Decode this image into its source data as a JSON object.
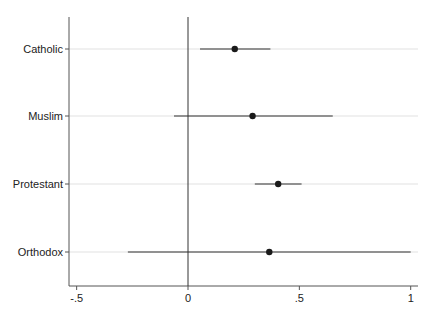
{
  "chart_data": {
    "type": "coefficient_plot",
    "title": "",
    "xlabel": "",
    "ylabel": "",
    "xlim": [
      -0.52,
      1.03
    ],
    "xticks": [
      -0.5,
      0,
      0.5,
      1
    ],
    "xtick_labels": [
      "-.5",
      "0",
      ".5",
      "1"
    ],
    "reference_line": 0,
    "grid": "horizontal",
    "categories": [
      "Catholic",
      "Muslim",
      "Protestant",
      "Orthodox"
    ],
    "estimates": [
      0.21,
      0.29,
      0.405,
      0.365
    ],
    "ci_lower": [
      0.054,
      -0.063,
      0.3,
      -0.27
    ],
    "ci_upper": [
      0.37,
      0.65,
      0.51,
      1.0
    ],
    "colors": {
      "point": "#1a1a1a",
      "ci_line": "#333333",
      "grid": "#d9d9d9",
      "axis": "#555555",
      "ref_line": "#333333"
    }
  }
}
